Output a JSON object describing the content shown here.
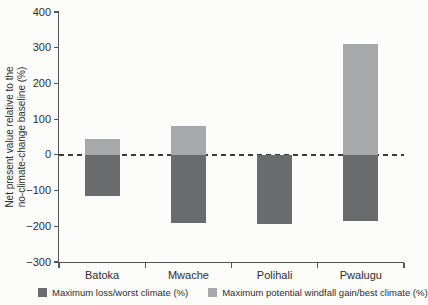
{
  "figure": {
    "ylabel_lines": [
      "Net present value relative to the",
      "no-climate-change baseline (%)"
    ]
  },
  "chart_data": {
    "type": "bar",
    "subtype": "diverging-stacked",
    "categories": [
      "Batoka",
      "Mwache",
      "Polihali",
      "Pwalugu"
    ],
    "series": [
      {
        "name": "Maximum loss/worst climate (%)",
        "color": "#6a6b6d",
        "values": [
          -115,
          -190,
          -195,
          -185
        ]
      },
      {
        "name": "Maximum potential windfall gain/best climate (%)",
        "color": "#a6a8aa",
        "values": [
          45,
          80,
          0,
          310
        ]
      }
    ],
    "title": "",
    "xlabel": "",
    "ylabel": "Net present value relative to the no-climate-change baseline (%)",
    "ylim": [
      -300,
      400
    ],
    "yticks": [
      400,
      300,
      200,
      100,
      0,
      -100,
      -200,
      -300
    ],
    "zero_line_style": "dashed",
    "grid": false,
    "legend_position": "bottom"
  },
  "colors": {
    "loss_bar": "#6a6b6d",
    "gain_bar": "#a6a8aa",
    "axis": "#55565a",
    "text": "#2e2e2e",
    "zero_line": "#3c3c3c",
    "background": "#fcfcfa"
  }
}
